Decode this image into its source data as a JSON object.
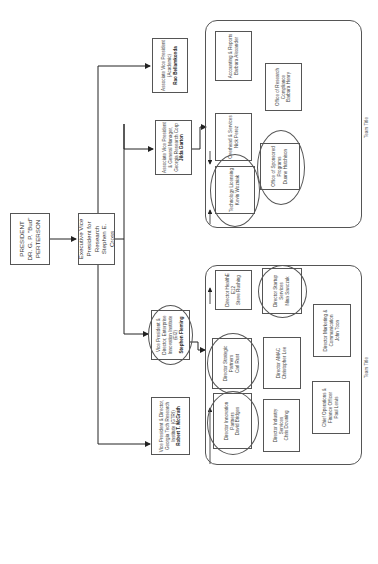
{
  "president": {
    "title": "PRESIDENT",
    "name": "DR. G. P. \"Bud\" PERTERSON"
  },
  "evp": {
    "title": "Executive Vice President for Research",
    "name": "Stephen E. Cross"
  },
  "direct_reports": [
    {
      "title": "Associate Vice President (Academic)",
      "name": "Rao Bellamkonda"
    },
    {
      "title": "Associate Vice President & General Manager, Georgia Research Corp",
      "name": "Jilda Garton"
    },
    {
      "title": "Vice President & Director, Enterprise Innovation Institute (EI2)",
      "name": "Stephen Fleming"
    },
    {
      "title": "Vice President & Director, Georgia Tech Research Institute (GTRI)",
      "name": "Robert T. McGrath"
    }
  ],
  "teams": [
    {
      "title": "Team Title",
      "members": [
        {
          "role": "Accounting & Reports",
          "name": "Barbara Alexander"
        },
        {
          "role": "Office of Research Compliance",
          "name": "Barbara Henry"
        },
        {
          "role": "Overhead & Services",
          "name": "Nick Perez"
        },
        {
          "role": "Office of Sponsored Programs",
          "name": "Duane Hutchison"
        },
        {
          "role": "Technology Licensing",
          "name": "Kevin Wozniak"
        }
      ]
    },
    {
      "title": "Team Title",
      "members": [
        {
          "role": "Director HealthE E12",
          "name": "Steve Rushing"
        },
        {
          "role": "Director Startup Services",
          "name": "Nina Sawczuk"
        },
        {
          "role": "Director Strategic Partners",
          "name": "Carl Rust"
        },
        {
          "role": "Director AMAC",
          "name": "Christopher Lee"
        },
        {
          "role": "Director Marketing & Communication",
          "name": "John Toon"
        },
        {
          "role": "Director Innovation Partners",
          "name": "David Bridges"
        },
        {
          "role": "Director Industry Services",
          "name": "Chris Downing"
        },
        {
          "role": "Chief Operations & Finance Officer",
          "name": "Paul Lewis"
        }
      ]
    }
  ]
}
